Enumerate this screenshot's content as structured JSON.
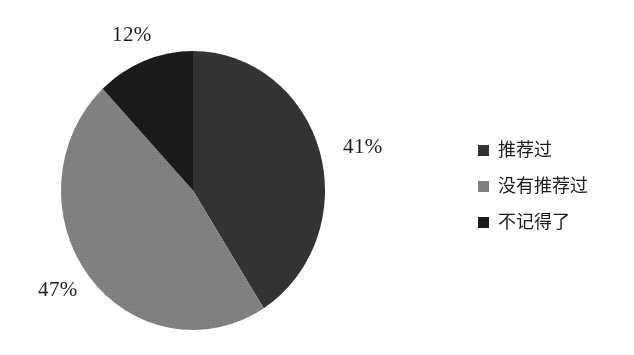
{
  "chart_data": {
    "type": "pie",
    "title": "",
    "subtitle": "",
    "xlabel": "",
    "ylabel": "",
    "grid": false,
    "legend_position": "right",
    "start_angle_deg": 0,
    "direction": "clockwise",
    "categories": [
      "推荐过",
      "没有推荐过",
      "不记得了"
    ],
    "values": [
      41,
      47,
      12
    ],
    "value_unit": "%",
    "colors": [
      "#333333",
      "#808080",
      "#1a1a1a"
    ],
    "slices": [
      {
        "label": "推荐过",
        "value": 41,
        "display": "41%",
        "color": "#333333",
        "start_deg": 0,
        "end_deg": 147.6
      },
      {
        "label": "没有推荐过",
        "value": 47,
        "display": "47%",
        "color": "#808080",
        "start_deg": 147.6,
        "end_deg": 316.8
      },
      {
        "label": "不记得了",
        "value": 12,
        "display": "12%",
        "color": "#1a1a1a",
        "start_deg": 316.8,
        "end_deg": 360
      }
    ]
  },
  "labels": {
    "top": "12%",
    "right": "41%",
    "lower_left": "47%"
  },
  "legend": {
    "items": [
      {
        "label": "推荐过",
        "color": "#333333",
        "swatch_name": "legend-swatch-recommended"
      },
      {
        "label": "没有推荐过",
        "color": "#808080",
        "swatch_name": "legend-swatch-not-recommended"
      },
      {
        "label": "不记得了",
        "color": "#1a1a1a",
        "swatch_name": "legend-swatch-dont-remember"
      }
    ]
  },
  "canvas": {
    "background": "#ffffff"
  }
}
